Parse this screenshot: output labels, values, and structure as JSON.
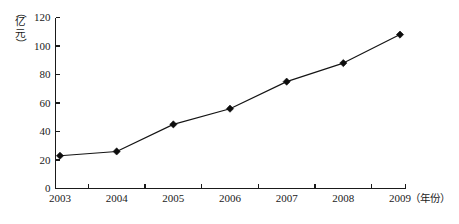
{
  "chart_data": {
    "type": "line",
    "title": "",
    "xlabel": "（年份）",
    "ylabel": "（亿元）",
    "ylabel_chars": [
      "（",
      "亿",
      "元",
      "）"
    ],
    "categories": [
      "2003",
      "2004",
      "2005",
      "2006",
      "2007",
      "2008",
      "2009"
    ],
    "values": [
      23,
      26,
      45,
      56,
      75,
      88,
      108
    ],
    "series": [
      {
        "name": "",
        "values": [
          23,
          26,
          45,
          56,
          75,
          88,
          108
        ]
      }
    ],
    "ylim": [
      0,
      120
    ],
    "ytick_step": 20,
    "yticks": [
      "0",
      "20",
      "40",
      "60",
      "80",
      "100",
      "120"
    ],
    "xticks": [
      "2003",
      "2004",
      "2005",
      "2006",
      "2007",
      "2008",
      "2009"
    ],
    "grid": false,
    "legend": false,
    "legend_position": "none",
    "marker": "diamond",
    "line_color": "#141414",
    "marker_color": "#0d0d0d",
    "axis_color": "#1a1a1a",
    "background_color": "#ffffff"
  }
}
